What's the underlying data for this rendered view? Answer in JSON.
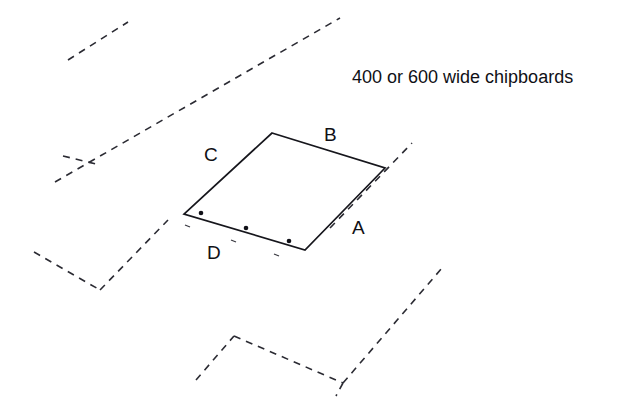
{
  "diagram": {
    "type": "construction-layout-diagram",
    "background_color": "#ffffff",
    "line_color": "#16161c",
    "dashed_line_color": "#2b2b33",
    "caption": {
      "text": "400 or 600 wide chipboards",
      "x": 352,
      "y": 78
    },
    "edge_labels": [
      {
        "id": "A",
        "text": "A",
        "x": 352,
        "y": 229
      },
      {
        "id": "B",
        "text": "B",
        "x": 324,
        "y": 136
      },
      {
        "id": "C",
        "text": "C",
        "x": 204,
        "y": 156
      },
      {
        "id": "D",
        "text": "D",
        "x": 207,
        "y": 254
      }
    ],
    "panel": {
      "name": "highlighted-chipboard-panel",
      "points": "272,133 385,168 305,250 184,214",
      "vertices": [
        {
          "label": "top",
          "x": 272,
          "y": 133
        },
        {
          "label": "right",
          "x": 385,
          "y": 168
        },
        {
          "label": "bottom",
          "x": 305,
          "y": 250
        },
        {
          "label": "left",
          "x": 184,
          "y": 214
        }
      ]
    },
    "fixing_dots": [
      {
        "x": 201,
        "y": 213
      },
      {
        "x": 246,
        "y": 228
      },
      {
        "x": 289,
        "y": 241
      }
    ],
    "fixing_ticks": [
      {
        "x1": 185,
        "y1": 225,
        "x2": 190,
        "y2": 227
      },
      {
        "x1": 231,
        "y1": 240,
        "x2": 236,
        "y2": 242
      },
      {
        "x1": 274,
        "y1": 254,
        "x2": 279,
        "y2": 256
      }
    ],
    "dashed_paths": [
      {
        "id": "board-edge-top-left-short",
        "d": "M 68 60 L 128 22"
      },
      {
        "id": "board-edge-long-diagonal-upper",
        "d": "M 62 180 L 412 143 L 412 143"
      },
      {
        "id": "board-edge-main-diagonal",
        "d": "M 55 182 L 340 18"
      },
      {
        "id": "board-edge-branch-left",
        "d": "M 63 156 L 96 164"
      },
      {
        "id": "board-edge-right-diagonal",
        "d": "M 330 228 L 412 143"
      },
      {
        "id": "board-edge-lower-left-branch",
        "d": "M 34 252 L 100 290"
      },
      {
        "id": "board-edge-lower-left-vertex",
        "d": "M 100 290 L 168 220"
      },
      {
        "id": "board-edge-bottom-left-run",
        "d": "M 196 380 L 234 336"
      },
      {
        "id": "board-edge-bottom-shallow",
        "d": "M 234 336 L 343 383"
      },
      {
        "id": "board-edge-bottom-right-diagonal",
        "d": "M 343 383 L 442 268"
      },
      {
        "id": "board-edge-bottom-right-tail",
        "d": "M 343 383 L 336 396"
      }
    ]
  }
}
